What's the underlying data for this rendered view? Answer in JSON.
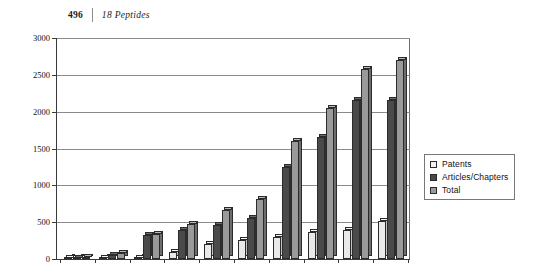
{
  "header": {
    "folio": "496",
    "running_title": "18  Peptides"
  },
  "legend": {
    "position": "right-middle",
    "items": [
      {
        "label": "Patents",
        "color": "#f2f2f2"
      },
      {
        "label": "Articles/Chapters",
        "color": "#4a4a4a"
      },
      {
        "label": "Total",
        "color": "#9a9a9a"
      }
    ]
  },
  "chart_data": {
    "type": "bar",
    "title": "",
    "xlabel": "",
    "ylabel": "",
    "ylim": [
      0,
      3000
    ],
    "ytick_labels": [
      "0",
      "500",
      "1000",
      "1500",
      "2000",
      "2500",
      "3000"
    ],
    "ytick_values": [
      0,
      500,
      1000,
      1500,
      2000,
      2500,
      3000
    ],
    "grid": true,
    "categories": [
      "1",
      "2",
      "3",
      "4",
      "5",
      "6",
      "7",
      "8",
      "9",
      "10"
    ],
    "xtick_labels": [
      "",
      "",
      "",
      "",
      "",
      "",
      "",
      "",
      "",
      ""
    ],
    "series": [
      {
        "name": "Patents",
        "color": "#f2f2f2",
        "values": [
          10,
          15,
          20,
          90,
          210,
          260,
          300,
          370,
          400,
          520
        ]
      },
      {
        "name": "Articles/Chapters",
        "color": "#4a4a4a",
        "values": [
          20,
          60,
          320,
          390,
          460,
          560,
          1250,
          1650,
          2160,
          2160
        ]
      },
      {
        "name": "Total",
        "color": "#9a9a9a",
        "values": [
          30,
          75,
          340,
          480,
          670,
          820,
          1600,
          2050,
          2580,
          2700
        ]
      }
    ]
  }
}
